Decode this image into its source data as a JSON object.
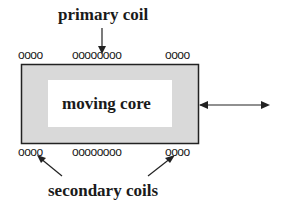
{
  "labels": {
    "primary": "primary coil",
    "core": "moving core",
    "secondary": "secondary coils"
  },
  "coils": {
    "top_left": "oooo",
    "top_center": "oooooooo",
    "top_right": "oooo",
    "bottom_left": "oooo",
    "bottom_center": "oooooooo",
    "bottom_right": "oooo"
  },
  "colors": {
    "frame_fill": "#d9d9d9",
    "stroke": "#222222",
    "inner_fill": "#ffffff"
  }
}
